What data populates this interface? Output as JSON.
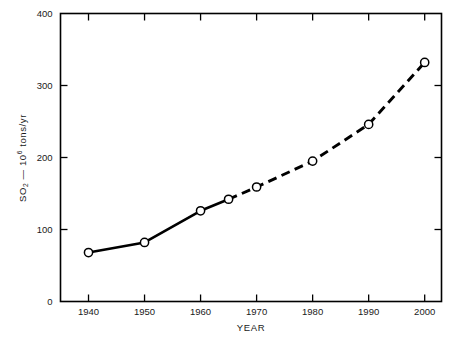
{
  "chart_data": {
    "type": "line",
    "title": "",
    "xlabel": "YEAR",
    "ylabel": "SO2 — 10^6 tons/yr",
    "ylabel_parts": {
      "species": "SO",
      "species_sub": "2",
      "dash": "—",
      "mantissa": "10",
      "exponent": "6",
      "units": " tons/yr"
    },
    "x": [
      1940,
      1950,
      1960,
      1965,
      1970,
      1980,
      1990,
      2000
    ],
    "values": [
      68,
      82,
      126,
      142,
      159,
      195,
      246,
      332
    ],
    "series": [
      {
        "name": "SO2 emissions (historical)",
        "style": "solid",
        "x": [
          1940,
          1950,
          1960,
          1965
        ],
        "values": [
          68,
          82,
          126,
          142
        ]
      },
      {
        "name": "SO2 emissions (projected)",
        "style": "dashed",
        "x": [
          1965,
          1970,
          1980,
          1990,
          2000
        ],
        "values": [
          142,
          159,
          195,
          246,
          332
        ]
      }
    ],
    "xlim": [
      1935,
      2003
    ],
    "ylim": [
      0,
      400
    ],
    "xticks": [
      1940,
      1950,
      1960,
      1970,
      1980,
      1990,
      2000
    ],
    "xtick_labels": [
      "1940",
      "1950",
      "1960",
      "1970",
      "1980",
      "1990",
      "2000"
    ],
    "yticks": [
      0,
      100,
      200,
      300,
      400
    ],
    "ytick_labels": [
      "0",
      "100",
      "200",
      "300",
      "400"
    ],
    "grid": false,
    "legend": "none",
    "marker": "open-circle",
    "colors": {
      "line": "#000000",
      "marker_fill": "#ffffff",
      "axis": "#000000",
      "background": "#ffffff"
    }
  }
}
